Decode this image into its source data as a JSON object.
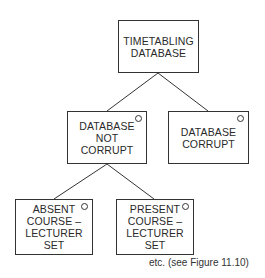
{
  "diagram": {
    "type": "jackson-structure-tree",
    "nodes": [
      {
        "id": "root",
        "lines": [
          "TIMETABLING",
          "DATABASE"
        ],
        "selection_marker": false
      },
      {
        "id": "not-corrupt",
        "lines": [
          "DATABASE",
          "NOT",
          "CORRUPT"
        ],
        "selection_marker": true
      },
      {
        "id": "corrupt",
        "lines": [
          "DATABASE",
          "CORRUPT"
        ],
        "selection_marker": true
      },
      {
        "id": "absent",
        "lines": [
          "ABSENT",
          "COURSE –",
          "LECTURER",
          "SET"
        ],
        "selection_marker": true
      },
      {
        "id": "present",
        "lines": [
          "PRESENT",
          "COURSE –",
          "LECTURER",
          "SET"
        ],
        "selection_marker": true
      }
    ],
    "edges": [
      {
        "from": "root",
        "to": "not-corrupt"
      },
      {
        "from": "root",
        "to": "corrupt"
      },
      {
        "from": "not-corrupt",
        "to": "absent"
      },
      {
        "from": "not-corrupt",
        "to": "present"
      }
    ],
    "selection_marker_symbol": "O",
    "caption": "etc. (see Figure 11.10)"
  }
}
